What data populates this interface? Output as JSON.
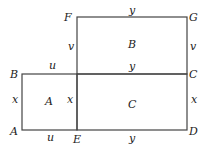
{
  "diagram": {
    "points": {
      "A": "A",
      "B": "B",
      "C": "C",
      "D": "D",
      "E": "E",
      "F": "F",
      "G": "G"
    },
    "regions": {
      "A": "A",
      "B": "B",
      "C": "C"
    },
    "edges": {
      "FG": "y",
      "BC_left": "u",
      "BC_right": "y",
      "AE": "u",
      "ED": "y",
      "AB": "x",
      "EF_lower": "x",
      "CD": "x",
      "EF_upper": "v",
      "GC": "v"
    },
    "stroke_color": "#444444"
  }
}
